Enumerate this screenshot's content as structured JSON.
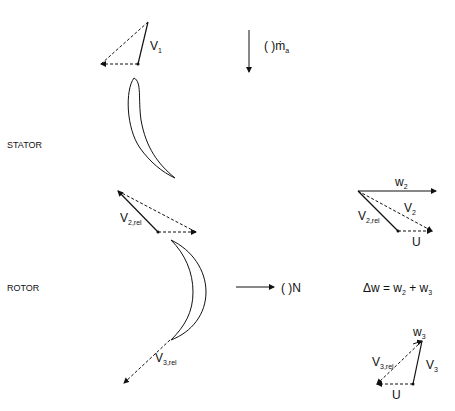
{
  "stages": {
    "stator": "STATOR",
    "rotor": "ROTOR"
  },
  "flow": {
    "mass_flow_label": "( )ṁ",
    "mass_flow_sub": "a",
    "rotation_label": "( )N"
  },
  "vectors": {
    "v1": {
      "main": "V",
      "sub": "1"
    },
    "v2rel": {
      "main": "V",
      "sub": "2,rel"
    },
    "v3rel": {
      "main": "V",
      "sub": "3,rel"
    },
    "w2": {
      "main": "w",
      "sub": "2"
    },
    "v2": {
      "main": "V",
      "sub": "2"
    },
    "u_top": "U",
    "w3": {
      "main": "w",
      "sub": "3"
    },
    "v3": {
      "main": "V",
      "sub": "3"
    },
    "u_bottom": "U"
  },
  "equation": {
    "lhs": "Δw = w",
    "sub1": "2",
    "mid": " + w",
    "sub2": "3"
  },
  "colors": {
    "line": "#111111",
    "background": "#ffffff"
  }
}
